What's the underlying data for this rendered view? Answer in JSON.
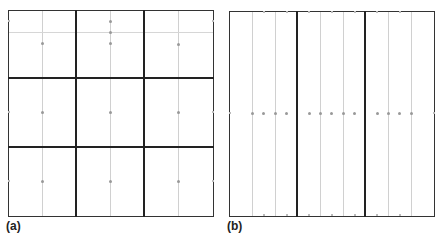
{
  "panels": [
    {
      "id": "a",
      "label": "(a)",
      "description": "3x3 grid of cells, each with a single center node; middle-top cell has extra nodes along a faint horizontal line"
    },
    {
      "id": "b",
      "label": "(b)",
      "description": "3 vertical strips, each subdivided by faint lines, with a row of nodes along the horizontal midline"
    }
  ],
  "colors": {
    "thick_line": "#222222",
    "thin_line": "#d0d0d0",
    "node": "#999999",
    "background": "#ffffff"
  }
}
